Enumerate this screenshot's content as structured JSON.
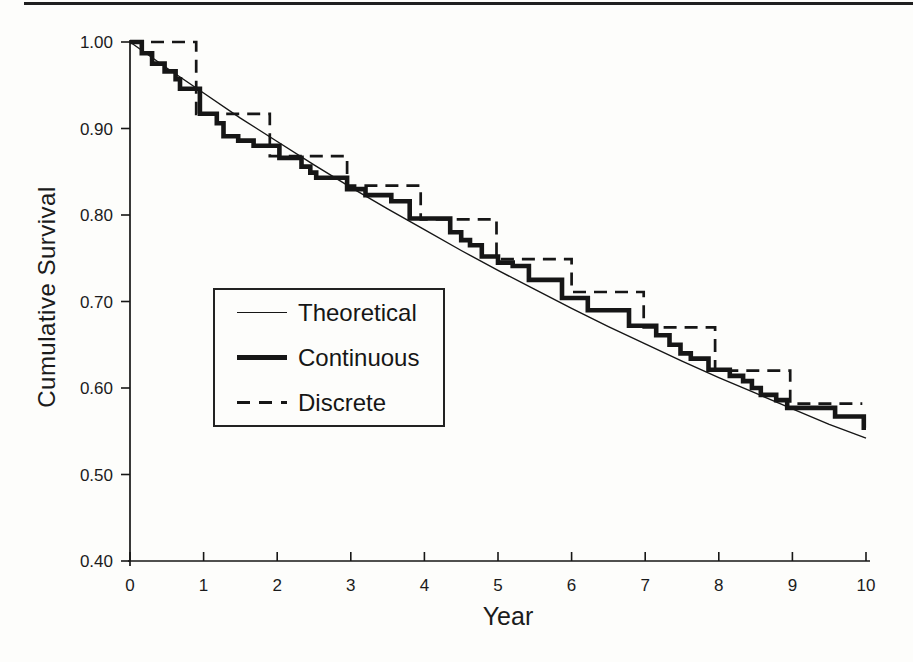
{
  "page": {
    "background": "#fdfdfb",
    "rule_color": "#1f1f1f",
    "ink_color": "#161616"
  },
  "chart_data": {
    "type": "line",
    "title": "",
    "xlabel": "Year",
    "ylabel": "Cumulative Survival",
    "xlim": [
      0,
      10
    ],
    "ylim": [
      0.4,
      1.0
    ],
    "x_ticks": [
      0,
      1,
      2,
      3,
      4,
      5,
      6,
      7,
      8,
      9,
      10
    ],
    "y_ticks": [
      "1.00",
      "0.90",
      "0.80",
      "0.70",
      "0.60",
      "0.50",
      "0.40"
    ],
    "grid": false,
    "legend_position": "inside-center-left",
    "series": [
      {
        "name": "Theoretical",
        "line_style": "thin-solid",
        "kind": "smooth",
        "x": [
          0,
          0.5,
          1,
          1.5,
          2,
          2.5,
          3,
          3.5,
          4,
          4.5,
          5,
          5.5,
          6,
          6.5,
          7,
          7.5,
          8,
          8.5,
          9,
          9.5,
          10
        ],
        "y": [
          1.0,
          0.97,
          0.941,
          0.912,
          0.885,
          0.858,
          0.832,
          0.807,
          0.783,
          0.759,
          0.736,
          0.714,
          0.692,
          0.671,
          0.651,
          0.631,
          0.612,
          0.594,
          0.576,
          0.558,
          0.542
        ]
      },
      {
        "name": "Continuous",
        "line_style": "thick-solid",
        "kind": "step",
        "end_t": 10.0,
        "steps": [
          [
            0.0,
            1.0
          ],
          [
            0.16,
            0.987
          ],
          [
            0.3,
            0.975
          ],
          [
            0.47,
            0.966
          ],
          [
            0.62,
            0.957
          ],
          [
            0.68,
            0.946
          ],
          [
            0.95,
            0.917
          ],
          [
            1.18,
            0.906
          ],
          [
            1.27,
            0.891
          ],
          [
            1.47,
            0.886
          ],
          [
            1.68,
            0.88
          ],
          [
            2.03,
            0.866
          ],
          [
            2.33,
            0.856
          ],
          [
            2.45,
            0.849
          ],
          [
            2.53,
            0.843
          ],
          [
            2.95,
            0.83
          ],
          [
            3.2,
            0.823
          ],
          [
            3.55,
            0.816
          ],
          [
            3.8,
            0.796
          ],
          [
            4.35,
            0.78
          ],
          [
            4.5,
            0.771
          ],
          [
            4.62,
            0.765
          ],
          [
            4.78,
            0.752
          ],
          [
            5.0,
            0.745
          ],
          [
            5.2,
            0.741
          ],
          [
            5.42,
            0.725
          ],
          [
            5.87,
            0.704
          ],
          [
            6.22,
            0.69
          ],
          [
            6.78,
            0.672
          ],
          [
            7.15,
            0.661
          ],
          [
            7.33,
            0.65
          ],
          [
            7.48,
            0.64
          ],
          [
            7.62,
            0.634
          ],
          [
            7.86,
            0.621
          ],
          [
            8.15,
            0.614
          ],
          [
            8.33,
            0.608
          ],
          [
            8.45,
            0.6
          ],
          [
            8.57,
            0.592
          ],
          [
            8.78,
            0.586
          ],
          [
            8.93,
            0.577
          ],
          [
            9.58,
            0.567
          ],
          [
            9.97,
            0.554
          ]
        ]
      },
      {
        "name": "Discrete",
        "line_style": "dashed",
        "kind": "step",
        "end_t": 9.95,
        "steps": [
          [
            0.0,
            1.0
          ],
          [
            0.9,
            0.917
          ],
          [
            1.9,
            0.868
          ],
          [
            2.95,
            0.834
          ],
          [
            3.95,
            0.795
          ],
          [
            4.98,
            0.749
          ],
          [
            6.0,
            0.711
          ],
          [
            6.98,
            0.67
          ],
          [
            7.95,
            0.62
          ],
          [
            8.97,
            0.582
          ]
        ]
      }
    ]
  }
}
